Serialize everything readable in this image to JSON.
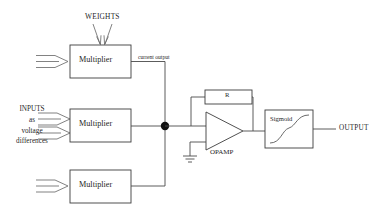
{
  "diagram": {
    "colors": {
      "background": "#ffffff",
      "line": "#4a4a4a",
      "box_stroke": "#3d3d3d",
      "text": "#1f1f1f",
      "junction_dot": "#111111"
    },
    "labels": {
      "weights": "WEIGHTS",
      "inputs_line1": "INPUTS",
      "inputs_line2": "as",
      "inputs_line3": "voltage",
      "inputs_line4": "differences",
      "current_output": "current output",
      "opamp": "OPAMP",
      "resistor": "R",
      "sigmoid": "Sigmoid",
      "output": "OUTPUT"
    },
    "blocks": [
      {
        "id": "multiplier-1",
        "label": "Multiplier",
        "x": 70,
        "y": 45,
        "w": 61,
        "h": 33
      },
      {
        "id": "multiplier-2",
        "label": "Multiplier",
        "x": 70,
        "y": 109,
        "w": 61,
        "h": 33
      },
      {
        "id": "multiplier-3",
        "label": "Multiplier",
        "x": 70,
        "y": 170,
        "w": 61,
        "h": 33
      },
      {
        "id": "resistor-r",
        "label": "R",
        "x": 205,
        "y": 90,
        "w": 47,
        "h": 14
      },
      {
        "id": "sigmoid",
        "label": "Sigmoid",
        "x": 265,
        "y": 110,
        "w": 48,
        "h": 38
      }
    ],
    "opamp": {
      "id": "opamp-triangle",
      "x": 206,
      "y": 112,
      "w": 37,
      "h": 38
    },
    "junction": {
      "id": "summing-node",
      "x": 165,
      "y": 126,
      "r": 4.2
    },
    "ground": {
      "id": "ground-symbol",
      "x": 190,
      "y": 156
    },
    "input_arrows": [
      {
        "id": "input-arrow-1",
        "y": 61
      },
      {
        "id": "input-arrow-2",
        "y": 119
      },
      {
        "id": "input-arrow-3",
        "y": 133
      },
      {
        "id": "input-arrow-4",
        "y": 186
      }
    ],
    "weight_arrows": [
      {
        "id": "weight-arrow-left",
        "x": 93
      },
      {
        "id": "weight-arrow-right",
        "x": 110
      }
    ]
  }
}
